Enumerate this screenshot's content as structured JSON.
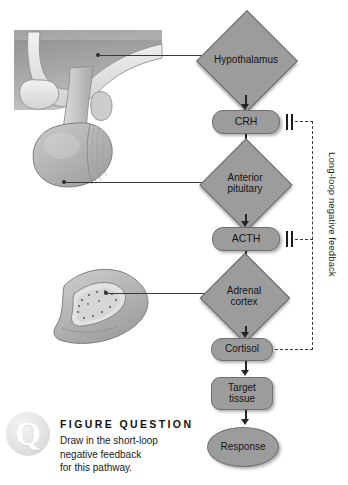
{
  "figure": {
    "type": "flow-diagram",
    "colors": {
      "node_fill": "#9c9c9c",
      "node_stroke": "#6b6b6b",
      "connector": "#262626",
      "feedback_dashed": "#3a3a3a",
      "background": "#ffffff"
    }
  },
  "pathway": {
    "nodes": [
      {
        "id": "hypothalamus",
        "label": "Hypothalamus",
        "shape": "diamond"
      },
      {
        "id": "crh",
        "label": "CRH",
        "shape": "rounded-rect"
      },
      {
        "id": "anterior-pituitary",
        "label": "Anterior\npituitary",
        "shape": "diamond",
        "line1": "Anterior",
        "line2": "pituitary"
      },
      {
        "id": "acth",
        "label": "ACTH",
        "shape": "rounded-rect"
      },
      {
        "id": "adrenal-cortex",
        "label": "Adrenal\ncortex",
        "shape": "diamond",
        "line1": "Adrenal",
        "line2": "cortex"
      },
      {
        "id": "cortisol",
        "label": "Cortisol",
        "shape": "rounded-rect"
      },
      {
        "id": "target-tissue",
        "label": "Target\ntissue",
        "shape": "rounded-rect",
        "line1": "Target",
        "line2": "tissue"
      },
      {
        "id": "response",
        "label": "Response",
        "shape": "ellipse"
      }
    ],
    "feedback": {
      "label": "Long-loop negative feedback",
      "source": "cortisol",
      "targets": [
        "crh",
        "acth"
      ],
      "style": "dashed",
      "sign": "inhibitory"
    }
  },
  "anatomy": {
    "items": [
      {
        "id": "brain-hypothalamus-art",
        "points_to": "hypothalamus"
      },
      {
        "id": "pituitary-gland-art",
        "points_to": "anterior-pituitary"
      },
      {
        "id": "adrenal-gland-art",
        "points_to": "adrenal-cortex"
      }
    ]
  },
  "figure_question": {
    "badge_letter": "Q",
    "heading": "FIGURE QUESTION",
    "body_line1": "Draw in the short-loop",
    "body_line2": "negative feedback",
    "body_line3": "for this pathway.",
    "body": "Draw in the short-loop negative feedback for this pathway."
  }
}
